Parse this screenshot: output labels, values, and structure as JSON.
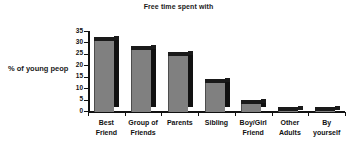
{
  "chart_data": {
    "type": "bar",
    "title": "Free time spent with",
    "xlabel": "",
    "ylabel": "% of young peop",
    "categories": [
      "Best Friend",
      "Group of Friends",
      "Parents",
      "Sibling",
      "Boy/Girl Friend",
      "Other Adults",
      "By yourself"
    ],
    "category_lines": [
      [
        "Best",
        "Friend"
      ],
      [
        "Group of",
        "Friends"
      ],
      [
        "Parents",
        ""
      ],
      [
        "Sibling",
        ""
      ],
      [
        "Boy/Girl",
        "Friend"
      ],
      [
        "Other",
        "Adults"
      ],
      [
        "By",
        "yourself"
      ]
    ],
    "values": [
      31,
      27,
      24.5,
      12.5,
      3.2,
      0.2,
      0.2
    ],
    "ylim": [
      0,
      35
    ],
    "ytick_labels": [
      "0",
      "5",
      "10",
      "15",
      "20",
      "25",
      "30",
      "35"
    ],
    "ytick_values": [
      0,
      5,
      10,
      15,
      20,
      25,
      30,
      35
    ],
    "grid": false,
    "legend": "none",
    "style": "3d-column",
    "colors": {
      "bar_face": "#808080",
      "bar_side": "#111111",
      "bar_top": "#1a1a1a",
      "axis": "#111111",
      "text": "#1a1a1a",
      "background": "#ffffff"
    }
  }
}
